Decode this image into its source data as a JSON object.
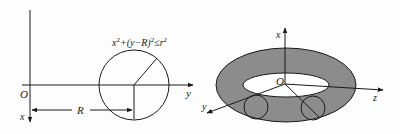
{
  "left_figure": {
    "origin_label": "O",
    "x_axis_label": "x",
    "y_axis_label": "y",
    "distance_label": "R",
    "formula": {
      "x": "x",
      "sup1": "2",
      "mid": "+(y−R)",
      "sup2": "2",
      "rel": "≤r",
      "sup3": "2"
    }
  },
  "right_figure": {
    "origin_label": "O",
    "x_axis_label": "x",
    "y_axis_label": "y",
    "z_axis_label": "z"
  },
  "colors": {
    "line": "#1a1a1a",
    "torus_fill": "#8c8c8c",
    "hole_fill": "#ffffff"
  }
}
